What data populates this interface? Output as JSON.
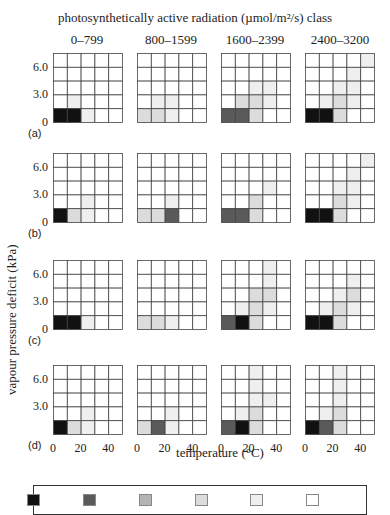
{
  "chart_data": {
    "type": "heatmap",
    "title": "photosynthetically active radiation (µmol/m²/s) class",
    "column_titles": [
      "0–799",
      "800–1599",
      "1600–2399",
      "2400–3200"
    ],
    "row_labels": [
      "(a)",
      "(b)",
      "(c)",
      "(d)"
    ],
    "xlabel": "temperature (°C)",
    "ylabel": "vapour pressure deficit (kPa)",
    "x_ticks": [
      "0",
      "20",
      "40"
    ],
    "y_ticks": [
      "6.0",
      "3.0",
      "0"
    ],
    "y_ticks_row_d": [
      "6.0",
      "3.0"
    ],
    "grid": "5x5",
    "shade_scale": "0 = white (lowest) to 5 = black (highest)",
    "shade_colors": [
      "#ffffff",
      "#efefef",
      "#dcdcdc",
      "#b4b4b4",
      "#5a5a5a",
      "#111111"
    ],
    "legend_swatch_levels": [
      5,
      4,
      3,
      2,
      1,
      0
    ],
    "panels": [
      [
        [
          [
            0,
            0,
            0,
            0,
            0
          ],
          [
            0,
            0,
            0,
            0,
            0
          ],
          [
            0,
            0,
            0,
            0,
            0
          ],
          [
            0,
            1,
            0,
            0,
            0
          ],
          [
            5,
            5,
            1,
            0,
            0
          ]
        ],
        [
          [
            0,
            0,
            0,
            0,
            0
          ],
          [
            0,
            0,
            0,
            0,
            0
          ],
          [
            0,
            0,
            0,
            0,
            0
          ],
          [
            0,
            1,
            1,
            0,
            0
          ],
          [
            2,
            2,
            1,
            0,
            0
          ]
        ],
        [
          [
            0,
            0,
            0,
            0,
            0
          ],
          [
            0,
            0,
            0,
            0,
            0
          ],
          [
            0,
            0,
            1,
            1,
            0
          ],
          [
            0,
            2,
            2,
            1,
            0
          ],
          [
            4,
            4,
            2,
            0,
            0
          ]
        ],
        [
          [
            0,
            0,
            0,
            0,
            1
          ],
          [
            0,
            0,
            0,
            1,
            0
          ],
          [
            0,
            0,
            1,
            1,
            0
          ],
          [
            0,
            1,
            2,
            1,
            0
          ],
          [
            5,
            5,
            2,
            0,
            0
          ]
        ]
      ],
      [
        [
          [
            0,
            0,
            0,
            0,
            0
          ],
          [
            0,
            0,
            0,
            0,
            0
          ],
          [
            0,
            0,
            0,
            0,
            0
          ],
          [
            0,
            0,
            1,
            0,
            0
          ],
          [
            5,
            2,
            1,
            0,
            0
          ]
        ],
        [
          [
            0,
            0,
            0,
            0,
            0
          ],
          [
            0,
            0,
            0,
            0,
            0
          ],
          [
            0,
            0,
            0,
            0,
            0
          ],
          [
            0,
            0,
            1,
            0,
            0
          ],
          [
            2,
            2,
            4,
            0,
            0
          ]
        ],
        [
          [
            0,
            0,
            0,
            0,
            0
          ],
          [
            0,
            0,
            0,
            0,
            0
          ],
          [
            0,
            0,
            0,
            1,
            0
          ],
          [
            0,
            0,
            2,
            0,
            0
          ],
          [
            4,
            4,
            2,
            0,
            0
          ]
        ],
        [
          [
            0,
            0,
            0,
            0,
            1
          ],
          [
            0,
            0,
            0,
            1,
            0
          ],
          [
            0,
            0,
            1,
            1,
            0
          ],
          [
            0,
            0,
            2,
            1,
            0
          ],
          [
            5,
            5,
            2,
            0,
            0
          ]
        ]
      ],
      [
        [
          [
            0,
            0,
            0,
            0,
            0
          ],
          [
            0,
            0,
            0,
            0,
            0
          ],
          [
            0,
            0,
            0,
            0,
            0
          ],
          [
            0,
            0,
            0,
            0,
            0
          ],
          [
            5,
            5,
            1,
            0,
            0
          ]
        ],
        [
          [
            0,
            0,
            0,
            0,
            0
          ],
          [
            0,
            0,
            0,
            0,
            0
          ],
          [
            0,
            0,
            0,
            0,
            0
          ],
          [
            0,
            0,
            0,
            0,
            0
          ],
          [
            2,
            2,
            1,
            0,
            0
          ]
        ],
        [
          [
            0,
            0,
            0,
            1,
            0
          ],
          [
            0,
            0,
            0,
            1,
            0
          ],
          [
            0,
            0,
            2,
            2,
            0
          ],
          [
            0,
            1,
            2,
            1,
            0
          ],
          [
            4,
            5,
            2,
            0,
            0
          ]
        ],
        [
          [
            0,
            0,
            0,
            0,
            0
          ],
          [
            0,
            0,
            0,
            1,
            0
          ],
          [
            0,
            0,
            1,
            2,
            0
          ],
          [
            0,
            1,
            2,
            1,
            0
          ],
          [
            5,
            5,
            2,
            0,
            0
          ]
        ]
      ],
      [
        [
          [
            0,
            0,
            0,
            0,
            0
          ],
          [
            0,
            0,
            0,
            0,
            0
          ],
          [
            0,
            0,
            0,
            0,
            0
          ],
          [
            0,
            0,
            1,
            0,
            0
          ],
          [
            5,
            2,
            1,
            0,
            0
          ]
        ],
        [
          [
            0,
            0,
            0,
            0,
            0
          ],
          [
            0,
            0,
            0,
            0,
            0
          ],
          [
            0,
            0,
            0,
            0,
            0
          ],
          [
            0,
            0,
            1,
            0,
            0
          ],
          [
            2,
            4,
            1,
            0,
            0
          ]
        ],
        [
          [
            0,
            0,
            1,
            0,
            0
          ],
          [
            0,
            0,
            1,
            0,
            0
          ],
          [
            0,
            0,
            1,
            1,
            0
          ],
          [
            0,
            1,
            2,
            0,
            0
          ],
          [
            4,
            5,
            2,
            0,
            0
          ]
        ],
        [
          [
            0,
            0,
            1,
            0,
            0
          ],
          [
            0,
            0,
            1,
            0,
            0
          ],
          [
            0,
            0,
            1,
            0,
            0
          ],
          [
            0,
            1,
            2,
            0,
            0
          ],
          [
            5,
            4,
            2,
            0,
            0
          ]
        ]
      ]
    ]
  }
}
